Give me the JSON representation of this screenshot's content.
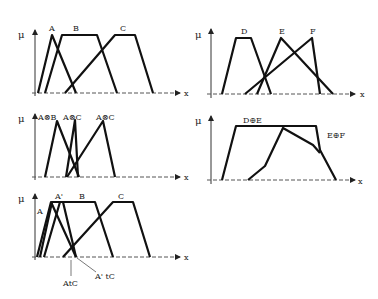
{
  "panels": [
    {
      "id": "p1",
      "y_label": "μ",
      "x_label": "x",
      "sets": [
        {
          "label": "A",
          "points": [
            [
              38,
              93
            ],
            [
              52,
              35
            ],
            [
              76,
              93
            ]
          ]
        },
        {
          "label": "B",
          "points": [
            [
              45,
              93
            ],
            [
              62,
              35
            ],
            [
              97,
              35
            ],
            [
              117,
              93
            ]
          ]
        },
        {
          "label": "C",
          "points": [
            [
              65,
              93
            ],
            [
              115,
              35
            ],
            [
              135,
              35
            ],
            [
              153,
              93
            ]
          ]
        }
      ]
    },
    {
      "id": "p2",
      "y_label": "μ",
      "x_label": "x",
      "sets": [
        {
          "label": "D",
          "points": [
            [
              222,
              94
            ],
            [
              236,
              38
            ],
            [
              251,
              38
            ],
            [
              271,
              94
            ]
          ]
        },
        {
          "label": "E",
          "points": [
            [
              257,
              94
            ],
            [
              281,
              38
            ],
            [
              333,
              94
            ]
          ]
        },
        {
          "label": "F",
          "points": [
            [
              245,
              94
            ],
            [
              312,
              38
            ],
            [
              320,
              94
            ]
          ]
        }
      ]
    },
    {
      "id": "p3",
      "y_label": "μ",
      "x_label": "x",
      "sets": [
        {
          "label": "A⊗B",
          "points": [
            [
              45,
              177
            ],
            [
              57,
              121
            ],
            [
              79,
              177
            ]
          ]
        },
        {
          "label": "A⊗C",
          "points": [
            [
              66,
              177
            ],
            [
              75,
              120
            ],
            [
              78,
              177
            ]
          ]
        },
        {
          "label": "A⊗C",
          "points": [
            [
              67,
              177
            ],
            [
              103,
              121
            ],
            [
              115,
              177
            ]
          ]
        }
      ]
    },
    {
      "id": "p4",
      "y_label": "μ",
      "x_label": "x",
      "sets": [
        {
          "label": "D⊕E",
          "points": [
            [
              222,
              180
            ],
            [
              236,
              126
            ],
            [
              316,
              126
            ],
            [
              320,
              150
            ],
            [
              336,
              180
            ]
          ]
        },
        {
          "label": "E⊕F",
          "points": [
            [
              248,
              180
            ],
            [
              265,
              166
            ],
            [
              283,
              128
            ],
            [
              313,
              145
            ],
            [
              320,
              153
            ]
          ]
        }
      ]
    },
    {
      "id": "p5",
      "y_label": "μ",
      "x_label": "x",
      "sets": [
        {
          "label": "A",
          "points": [
            [
              37,
              257
            ],
            [
              51,
              202
            ],
            [
              76,
              257
            ]
          ]
        },
        {
          "label": "A'",
          "points": [
            [
              40,
              257
            ],
            [
              52,
              202
            ],
            [
              63,
              202
            ],
            [
              76,
              257
            ]
          ]
        },
        {
          "label": "B",
          "points": [
            [
              44,
              257
            ],
            [
              60,
              202
            ],
            [
              95,
              202
            ],
            [
              113,
              257
            ]
          ]
        },
        {
          "label": "C",
          "points": [
            [
              63,
              257
            ],
            [
              113,
              202
            ],
            [
              133,
              202
            ],
            [
              150,
              257
            ]
          ]
        }
      ],
      "annotations": [
        {
          "label": "AtC"
        },
        {
          "label": "A' tC"
        }
      ]
    }
  ]
}
